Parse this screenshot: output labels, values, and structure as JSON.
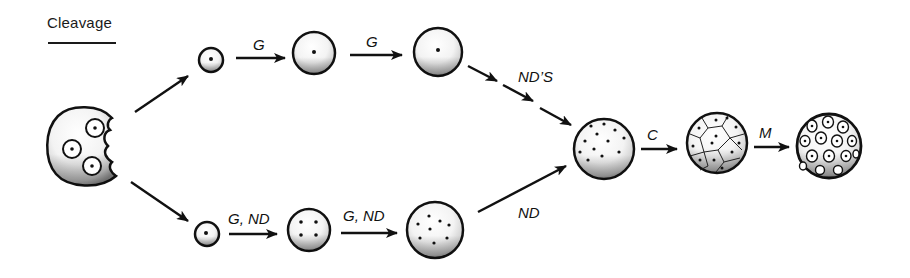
{
  "diagram": {
    "title": "Cleavage",
    "colors": {
      "ink": "#111111",
      "stipple": "#444444",
      "background": "#ffffff"
    },
    "nodes": [
      {
        "id": "fertilized-egg",
        "label": "",
        "cx": 88,
        "cy": 148,
        "r": 40,
        "nuclei": 3,
        "type": "notched-egg"
      },
      {
        "id": "top-1",
        "cx": 211,
        "cy": 60,
        "r": 12,
        "nuclei": 1
      },
      {
        "id": "top-2",
        "cx": 314,
        "cy": 53,
        "r": 21,
        "nuclei": 1
      },
      {
        "id": "top-3",
        "cx": 438,
        "cy": 52,
        "r": 24,
        "nuclei": 1
      },
      {
        "id": "bottom-1",
        "cx": 207,
        "cy": 234,
        "r": 12,
        "nuclei": 1
      },
      {
        "id": "bottom-2",
        "cx": 309,
        "cy": 230,
        "r": 21,
        "nuclei": 4
      },
      {
        "id": "bottom-3",
        "cx": 435,
        "cy": 230,
        "r": 28,
        "nuclei": 8
      },
      {
        "id": "syncytium",
        "cx": 604,
        "cy": 149,
        "r": 30,
        "nuclei": 12
      },
      {
        "id": "cellularised",
        "cx": 717,
        "cy": 143,
        "r": 30,
        "type": "polygonal-cells"
      },
      {
        "id": "differentiated",
        "cx": 829,
        "cy": 146,
        "r": 32,
        "type": "round-cells"
      }
    ],
    "edges": [
      {
        "from": "fertilized-egg",
        "to": "top-1",
        "label": ""
      },
      {
        "from": "top-1",
        "to": "top-2",
        "label": "G"
      },
      {
        "from": "top-2",
        "to": "top-3",
        "label": "G"
      },
      {
        "from": "top-3",
        "to": "syncytium",
        "label": "ND'S",
        "style": "multi-step"
      },
      {
        "from": "fertilized-egg",
        "to": "bottom-1",
        "label": ""
      },
      {
        "from": "bottom-1",
        "to": "bottom-2",
        "label": "G, ND"
      },
      {
        "from": "bottom-2",
        "to": "bottom-3",
        "label": "G, ND"
      },
      {
        "from": "bottom-3",
        "to": "syncytium",
        "label": "ND"
      },
      {
        "from": "syncytium",
        "to": "cellularised",
        "label": "C"
      },
      {
        "from": "cellularised",
        "to": "differentiated",
        "label": "M"
      }
    ],
    "labels": {
      "top_g1": "G",
      "top_g2": "G",
      "nds": "ND’S",
      "bottom_gnd1": "G, ND",
      "bottom_gnd2": "G, ND",
      "nd": "ND",
      "c": "C",
      "m": "M"
    }
  }
}
